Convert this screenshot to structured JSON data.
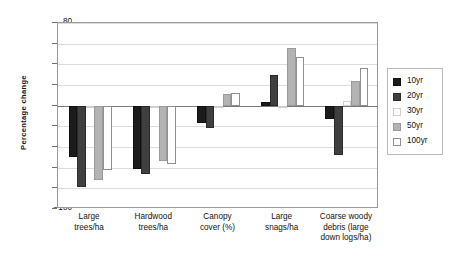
{
  "chart_data": {
    "type": "bar",
    "title": "",
    "xlabel": "",
    "ylabel": "Percentage change",
    "ylim": [
      -100,
      80
    ],
    "yticks": [
      80,
      60,
      40,
      20,
      0,
      -20,
      -40,
      -60,
      -80,
      -100
    ],
    "ytick_labels": [
      "80",
      "60",
      "40",
      "20",
      "0",
      "−20",
      "−40",
      "−60",
      "−80",
      "−100"
    ],
    "grid": true,
    "legend_position": "right",
    "categories": [
      "Large trees/ha",
      "Hardwood trees/ha",
      "Canopy cover (%)",
      "Large snags/ha",
      "Coarse woody debris (large down logs/ha)"
    ],
    "category_lines": [
      [
        "Large",
        "trees/ha"
      ],
      [
        "Hardwood",
        "trees/ha"
      ],
      [
        "Canopy",
        "cover (%)"
      ],
      [
        "Large",
        "snags/ha"
      ],
      [
        "Coarse woody",
        "debris (large",
        "down logs/ha)"
      ]
    ],
    "series": [
      {
        "name": "10yr",
        "color": "#1b1b1b",
        "values": [
          -50,
          -61,
          -17,
          4,
          -13
        ]
      },
      {
        "name": "20yr",
        "color": "#3f3f3f",
        "values": [
          -79,
          -66,
          -22,
          30,
          -48
        ]
      },
      {
        "name": "30yr",
        "color": "#fcfcfc",
        "values": [
          0,
          0,
          0,
          0,
          5
        ]
      },
      {
        "name": "50yr",
        "color": "#b3b3b3",
        "values": [
          -72,
          -54,
          11,
          56,
          24
        ]
      },
      {
        "name": "100yr",
        "color": "#ffffff",
        "values": [
          -62,
          -56,
          12,
          47,
          36
        ]
      }
    ]
  },
  "legend": {
    "items": [
      {
        "label": "10yr"
      },
      {
        "label": "20yr"
      },
      {
        "label": "30yr"
      },
      {
        "label": "50yr"
      },
      {
        "label": "100yr"
      }
    ]
  }
}
